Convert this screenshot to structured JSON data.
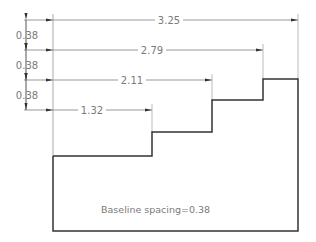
{
  "diagram": {
    "type": "baseline-dimensioning-drawing",
    "note": "Baseline spacing=0.38",
    "horizontal_dimensions": [
      {
        "label": "3.25",
        "y": 20,
        "x_end": 298
      },
      {
        "label": "2.79",
        "y": 50,
        "x_end": 263
      },
      {
        "label": "2.11",
        "y": 80,
        "x_end": 212
      },
      {
        "label": "1.32",
        "y": 110,
        "x_end": 152
      }
    ],
    "vertical_dimensions": [
      {
        "label": "0.38"
      },
      {
        "label": "0.38"
      },
      {
        "label": "0.38"
      }
    ],
    "colors": {
      "outline": "#333333",
      "dimension": "#8a8a8a",
      "text": "#7a7a7a"
    }
  }
}
